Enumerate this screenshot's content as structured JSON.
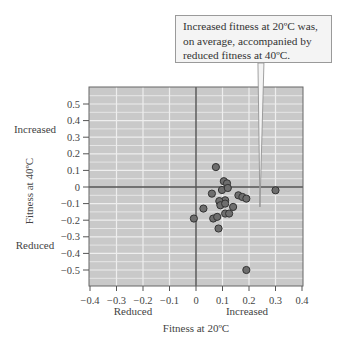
{
  "chart_data": {
    "type": "scatter",
    "title": "",
    "xlabel": "Fitness at 20ºC",
    "ylabel": "Fitness at 40ºC",
    "xlim": [
      -0.4,
      0.4
    ],
    "ylim": [
      -0.6,
      0.6
    ],
    "xticks": [
      "-0.4",
      "-0.3",
      "-0.2",
      "-0.1",
      "0",
      "0.1",
      "0.2",
      "0.3",
      "0.4"
    ],
    "xtick_values": [
      -0.4,
      -0.3,
      -0.2,
      -0.1,
      0,
      0.1,
      0.2,
      0.3,
      0.4
    ],
    "yticks": [
      "0.5",
      "0.4",
      "0.3",
      "0.2",
      "0.1",
      "0",
      "-0.1",
      "-0.2",
      "-0.3",
      "-0.4",
      "-0.5"
    ],
    "ytick_values": [
      0.5,
      0.4,
      0.3,
      0.2,
      0.1,
      0,
      -0.1,
      -0.2,
      -0.3,
      -0.4,
      -0.5
    ],
    "x_region_labels": {
      "negative": "Reduced",
      "positive": "Increased"
    },
    "y_region_labels": {
      "positive": "Increased",
      "negative": "Reduced"
    },
    "grid": true,
    "annotation": {
      "text_lines": [
        "Increased fitness at 20ºC was,",
        "on average, accompanied by",
        "reduced fitness at 40ºC."
      ],
      "points_to": [
        0.23,
        -0.12
      ]
    },
    "points": [
      {
        "x": 0.075,
        "y": 0.12
      },
      {
        "x": 0.105,
        "y": 0.035
      },
      {
        "x": 0.117,
        "y": 0.022
      },
      {
        "x": 0.098,
        "y": -0.018
      },
      {
        "x": 0.12,
        "y": -0.006
      },
      {
        "x": 0.06,
        "y": -0.04
      },
      {
        "x": 0.16,
        "y": -0.05
      },
      {
        "x": 0.175,
        "y": -0.06
      },
      {
        "x": 0.19,
        "y": -0.07
      },
      {
        "x": 0.3,
        "y": -0.02
      },
      {
        "x": 0.09,
        "y": -0.09
      },
      {
        "x": 0.11,
        "y": -0.08
      },
      {
        "x": 0.088,
        "y": -0.085
      },
      {
        "x": 0.092,
        "y": -0.11
      },
      {
        "x": 0.11,
        "y": -0.1
      },
      {
        "x": 0.14,
        "y": -0.12
      },
      {
        "x": 0.028,
        "y": -0.13
      },
      {
        "x": -0.008,
        "y": -0.19
      },
      {
        "x": 0.065,
        "y": -0.19
      },
      {
        "x": 0.08,
        "y": -0.18
      },
      {
        "x": 0.11,
        "y": -0.16
      },
      {
        "x": 0.125,
        "y": -0.16
      },
      {
        "x": 0.085,
        "y": -0.25
      },
      {
        "x": 0.19,
        "y": -0.5
      }
    ]
  },
  "colors": {
    "plot_bg": "#c9c9c9",
    "grid": "#eeeeee",
    "zero_line": "#555555",
    "point_fill": "#6e6e6e",
    "point_stroke": "#333333"
  }
}
